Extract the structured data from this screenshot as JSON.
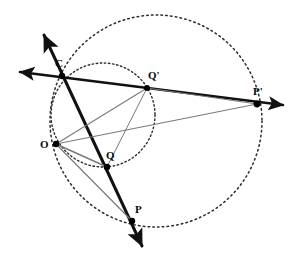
{
  "figure": {
    "canvas": {
      "width": 292,
      "height": 258,
      "background": "#ffffff"
    },
    "stroke_colors": {
      "heavy_line": "#111111",
      "thin_line": "#7a7a7a",
      "dotted_circle": "#2b2b2b",
      "point_fill": "#000000",
      "label_text": "#0b0b0b"
    }
  },
  "points": [
    {
      "id": "C",
      "label": "C",
      "x": 62,
      "y": 76,
      "label_x": 55,
      "label_y": 58,
      "radius": 3.2
    },
    {
      "id": "Q1",
      "label": "Q'",
      "x": 147,
      "y": 88,
      "label_x": 148,
      "label_y": 70,
      "radius": 3.0
    },
    {
      "id": "P1",
      "label": "P'",
      "x": 257,
      "y": 104,
      "label_x": 253,
      "label_y": 86,
      "radius": 3.4
    },
    {
      "id": "O",
      "label": "O",
      "x": 56,
      "y": 144,
      "label_x": 40,
      "label_y": 139,
      "radius": 3.2
    },
    {
      "id": "Q",
      "label": "Q",
      "x": 107,
      "y": 167,
      "label_x": 106,
      "label_y": 150,
      "radius": 3.2
    },
    {
      "id": "P",
      "label": "P",
      "x": 132,
      "y": 221,
      "label_x": 135,
      "label_y": 204,
      "radius": 3.2
    }
  ],
  "circles": [
    {
      "id": "large-dotted-circle",
      "name": "large-circle-through-P-and-P-prime",
      "cx": 156,
      "cy": 121,
      "r": 106,
      "style": "dotted",
      "dash": "1.6 3.2",
      "stroke": "#2b2b2b",
      "stroke_width": 1.5
    },
    {
      "id": "small-dotted-circle",
      "name": "small-circle-through-C-Q-Q-prime",
      "cx": 103,
      "cy": 115,
      "r": 52,
      "style": "dotted",
      "dash": "1.5 2.6",
      "stroke": "#2b2b2b",
      "stroke_width": 1.4
    }
  ],
  "lines": [
    {
      "id": "ray-C-P",
      "name": "heavy-ray-through-C-Q-P",
      "x1": 44,
      "y1": 35,
      "x2": 142,
      "y2": 246,
      "weight": "heavy",
      "stroke_width": 3.0,
      "arrow_start": true,
      "arrow_end": true
    },
    {
      "id": "ray-C-Pprime",
      "name": "heavy-ray-through-C-Qprime-Pprime",
      "x1": 20,
      "y1": 72,
      "x2": 283,
      "y2": 105,
      "weight": "heavy",
      "stroke_width": 2.6,
      "arrow_start": true,
      "arrow_end": true
    },
    {
      "id": "seg-O-Qprime",
      "name": "thin-segment-O-to-Q-prime",
      "x1": 56,
      "y1": 144,
      "x2": 147,
      "y2": 88,
      "weight": "thin",
      "stroke_width": 1.1,
      "arrow_start": false,
      "arrow_end": false
    },
    {
      "id": "seg-O-Pprime",
      "name": "thin-segment-O-to-P-prime",
      "x1": 56,
      "y1": 144,
      "x2": 257,
      "y2": 104,
      "weight": "thin",
      "stroke_width": 1.1,
      "arrow_start": false,
      "arrow_end": false
    },
    {
      "id": "seg-O-Q",
      "name": "thin-segment-O-to-Q",
      "x1": 56,
      "y1": 144,
      "x2": 107,
      "y2": 167,
      "weight": "thin",
      "stroke_width": 1.4,
      "arrow_start": false,
      "arrow_end": false
    },
    {
      "id": "seg-O-P",
      "name": "thin-segment-O-to-P",
      "x1": 56,
      "y1": 144,
      "x2": 132,
      "y2": 221,
      "weight": "thin",
      "stroke_width": 1.2,
      "arrow_start": false,
      "arrow_end": false
    },
    {
      "id": "seg-Qprime-Q",
      "name": "thin-segment-Q-prime-to-Q",
      "x1": 147,
      "y1": 88,
      "x2": 107,
      "y2": 167,
      "weight": "thin",
      "stroke_width": 1.0,
      "arrow_start": false,
      "arrow_end": false
    },
    {
      "id": "seg-Qprime-Pprime",
      "name": "thin-segment-Q-prime-to-P-prime",
      "x1": 147,
      "y1": 88,
      "x2": 257,
      "y2": 104,
      "weight": "thin",
      "stroke_width": 1.0,
      "arrow_start": false,
      "arrow_end": false
    }
  ]
}
